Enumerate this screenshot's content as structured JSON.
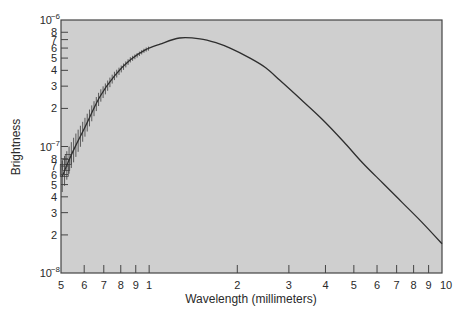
{
  "chart_data": {
    "type": "line",
    "title": "",
    "xlabel": "Wavelength (millimeters)",
    "ylabel": "Brightness",
    "xscale": "log",
    "yscale": "log",
    "xlim": [
      0.5,
      10
    ],
    "ylim": [
      1e-08,
      1e-06
    ],
    "grid": false,
    "legend": null,
    "x_ticks": [
      {
        "value": 0.5,
        "label": "5"
      },
      {
        "value": 0.6,
        "label": "6"
      },
      {
        "value": 0.7,
        "label": "7"
      },
      {
        "value": 0.8,
        "label": "8"
      },
      {
        "value": 0.9,
        "label": "9"
      },
      {
        "value": 1,
        "label": "1"
      },
      {
        "value": 2,
        "label": "2"
      },
      {
        "value": 3,
        "label": "3"
      },
      {
        "value": 4,
        "label": "4"
      },
      {
        "value": 5,
        "label": "5"
      },
      {
        "value": 6,
        "label": "6"
      },
      {
        "value": 7,
        "label": "7"
      },
      {
        "value": 8,
        "label": "8"
      },
      {
        "value": 9,
        "label": "9"
      },
      {
        "value": 10,
        "label": "10"
      }
    ],
    "y_ticks": [
      {
        "value": 1e-08,
        "label": "10",
        "exp": "−8"
      },
      {
        "value": 2e-08,
        "label": "2"
      },
      {
        "value": 3e-08,
        "label": "3"
      },
      {
        "value": 4e-08,
        "label": "4"
      },
      {
        "value": 5e-08,
        "label": "5"
      },
      {
        "value": 6e-08,
        "label": "6"
      },
      {
        "value": 7e-08,
        "label": "7"
      },
      {
        "value": 8e-08,
        "label": "8"
      },
      {
        "value": 1e-07,
        "label": "10",
        "exp": "−7"
      },
      {
        "value": 2e-07,
        "label": "2"
      },
      {
        "value": 3e-07,
        "label": "3"
      },
      {
        "value": 4e-07,
        "label": "4"
      },
      {
        "value": 5e-07,
        "label": "5"
      },
      {
        "value": 6e-07,
        "label": "6"
      },
      {
        "value": 7e-07,
        "label": "7"
      },
      {
        "value": 8e-07,
        "label": "8"
      },
      {
        "value": 1e-06,
        "label": "10",
        "exp": "−6"
      }
    ],
    "series": [
      {
        "name": "Brightness spectrum",
        "x": [
          0.505,
          0.53,
          0.558,
          0.6,
          0.678,
          0.76,
          0.861,
          0.97,
          1.09,
          1.27,
          1.49,
          1.7,
          1.89,
          2.21,
          2.5,
          2.79,
          3.3,
          3.92,
          4.6,
          5.36,
          6.3,
          7.32,
          8.5,
          10.0
        ],
        "values": [
          5.8e-08,
          7.6e-08,
          9.9e-08,
          1.38e-07,
          2.46e-07,
          3.6e-07,
          4.83e-07,
          5.8e-07,
          6.45e-07,
          7.2e-07,
          7.1e-07,
          6.6e-07,
          6e-07,
          5e-07,
          4.2e-07,
          3.35e-07,
          2.35e-07,
          1.62e-07,
          1.1e-07,
          7.4e-08,
          5.1e-08,
          3.6e-08,
          2.55e-08,
          1.7e-08
        ]
      }
    ],
    "annotations": [
      "error-bar hatch marks along rising curve between 0.5 and 1.0 mm"
    ],
    "colors": {
      "plot_background": "#cfcfcf",
      "line": "#2e2e2e",
      "axis": "#444444"
    }
  }
}
